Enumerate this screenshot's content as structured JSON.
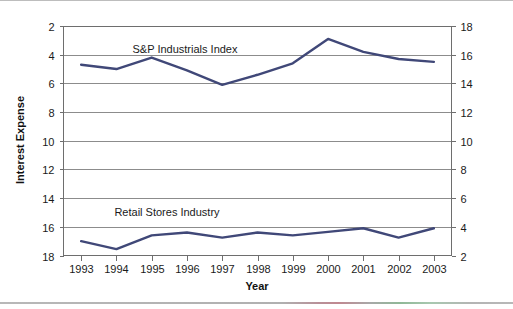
{
  "chart_data": {
    "type": "line",
    "title": "",
    "xlabel": "Year",
    "ylabel": "Interest Expense",
    "categories": [
      "1993",
      "1994",
      "1995",
      "1996",
      "1997",
      "1998",
      "1999",
      "2000",
      "2001",
      "2002",
      "2003"
    ],
    "x": [
      1993,
      1994,
      1995,
      1996,
      1997,
      1998,
      1999,
      2000,
      2001,
      2002,
      2003
    ],
    "ylim": [
      2,
      18
    ],
    "y_ticks": [
      2,
      4,
      6,
      8,
      10,
      12,
      14,
      16,
      18
    ],
    "y_ticks_right": [
      2,
      4,
      6,
      8,
      10,
      12,
      14,
      16,
      18
    ],
    "right_axis": true,
    "grid": "horizontal",
    "legend_position": "inline-annotation",
    "series": [
      {
        "name": "S&P Industrials Index",
        "color": "#404878",
        "values": [
          15.3,
          15.0,
          15.8,
          14.9,
          13.9,
          14.6,
          15.4,
          17.1,
          16.2,
          15.7,
          15.5
        ]
      },
      {
        "name": "Retail Stores Industry",
        "color": "#404878",
        "values": [
          3.0,
          2.45,
          3.4,
          3.6,
          3.25,
          3.6,
          3.4,
          3.65,
          3.9,
          3.25,
          3.9
        ]
      }
    ],
    "annotations": [
      {
        "text": "S&P Industrials Index",
        "x_px": 185,
        "y_px": 53
      },
      {
        "text": "Retail Stores Industry",
        "x_px": 167,
        "y_px": 216
      }
    ]
  },
  "axes": {
    "left_tick_labels": [
      "18",
      "16",
      "14",
      "12",
      "10",
      "8",
      "6",
      "4",
      "2"
    ],
    "right_tick_labels": [
      "18",
      "16",
      "14",
      "12",
      "10",
      "8",
      "6",
      "4",
      "2"
    ],
    "x_tick_labels": [
      "1993",
      "1994",
      "1995",
      "1996",
      "1997",
      "1998",
      "1999",
      "2000",
      "2001",
      "2002",
      "2003"
    ],
    "y_axis_title": "Interest Expense",
    "x_axis_title": "Year"
  },
  "style": {
    "line_color": "#404878",
    "grid_color": "#8c8c8c",
    "frame_color": "#6e6e6e",
    "text_color": "#1a1a1a",
    "background": "#ffffff"
  }
}
